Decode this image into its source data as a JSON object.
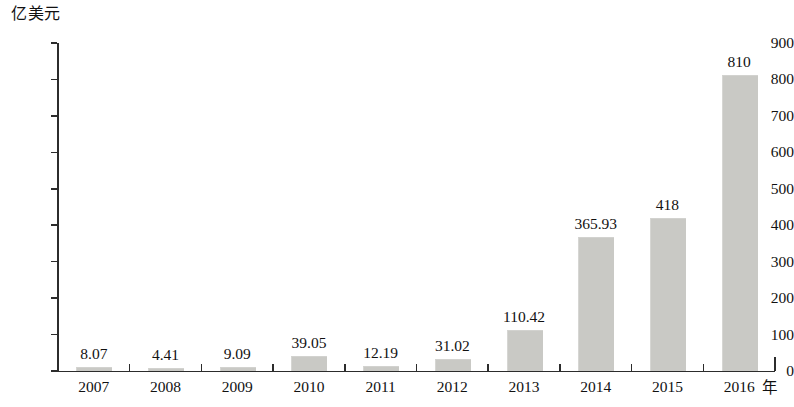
{
  "chart_data": {
    "type": "bar",
    "title": "",
    "subtitle": "",
    "xlabel": "年",
    "ylabel": "亿美元",
    "categories": [
      "2007",
      "2008",
      "2009",
      "2010",
      "2011",
      "2012",
      "2013",
      "2014",
      "2015",
      "2016"
    ],
    "values": [
      8.07,
      4.41,
      9.09,
      39.05,
      12.19,
      31.02,
      110.42,
      365.93,
      418,
      810
    ],
    "value_labels": [
      "8.07",
      "4.41",
      "9.09",
      "39.05",
      "12.19",
      "31.02",
      "110.42",
      "365.93",
      "418",
      "810"
    ],
    "ylim": [
      0,
      900
    ],
    "ytick_labels": [
      "0",
      "100",
      "200",
      "300",
      "400",
      "500",
      "600",
      "700",
      "800",
      "900"
    ],
    "ytick_values": [
      0,
      100,
      200,
      300,
      400,
      500,
      600,
      700,
      800,
      900
    ],
    "grid": false,
    "legend": null,
    "legend_position": "none",
    "bar_color": "#c9c9c5",
    "axis_color": "#2c2c2c",
    "text_color": "#111111",
    "background_color": "#ffffff"
  }
}
